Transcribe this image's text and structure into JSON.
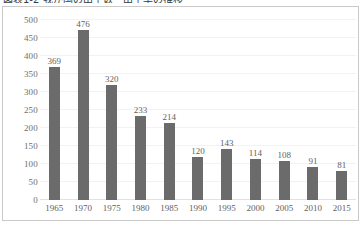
{
  "chart_data": {
    "type": "bar",
    "title": "図表1-2 我が国の出生数・出生率の推移",
    "xlabel": "",
    "ylabel": "",
    "categories": [
      "1965",
      "1970",
      "1975",
      "1980",
      "1985",
      "1990",
      "1995",
      "2000",
      "2005",
      "2010",
      "2015"
    ],
    "values": [
      369,
      476,
      320,
      233,
      214,
      120,
      143,
      114,
      108,
      91,
      81
    ],
    "data_labels": [
      "369",
      "476",
      "320",
      "233",
      "214",
      "120",
      "143",
      "114",
      "108",
      "91",
      "81"
    ],
    "ylim": [
      0,
      500
    ],
    "ytick_step": 50,
    "ytick_labels": [
      "500",
      "450",
      "400",
      "350",
      "300",
      "250",
      "200",
      "150",
      "100",
      "50",
      "0"
    ],
    "grid": true,
    "legend": false,
    "bar_color": "#6b6b6b",
    "gridline_color": "#f2f2f2",
    "axis_text_color": "#5f5f5f",
    "frame_color": "#c9c9c9",
    "background": "#ffffff"
  }
}
